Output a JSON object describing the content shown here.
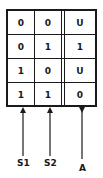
{
  "truth_table": {
    "rows": [
      {
        "s1": "0",
        "s2": "0",
        "a": "U"
      },
      {
        "s1": "0",
        "s2": "1",
        "a": "1"
      },
      {
        "s1": "1",
        "s2": "0",
        "a": "U"
      },
      {
        "s1": "1",
        "s2": "1",
        "a": "0"
      }
    ]
  },
  "labels": {
    "s1": "S1",
    "s2": "S2",
    "a": "A"
  }
}
